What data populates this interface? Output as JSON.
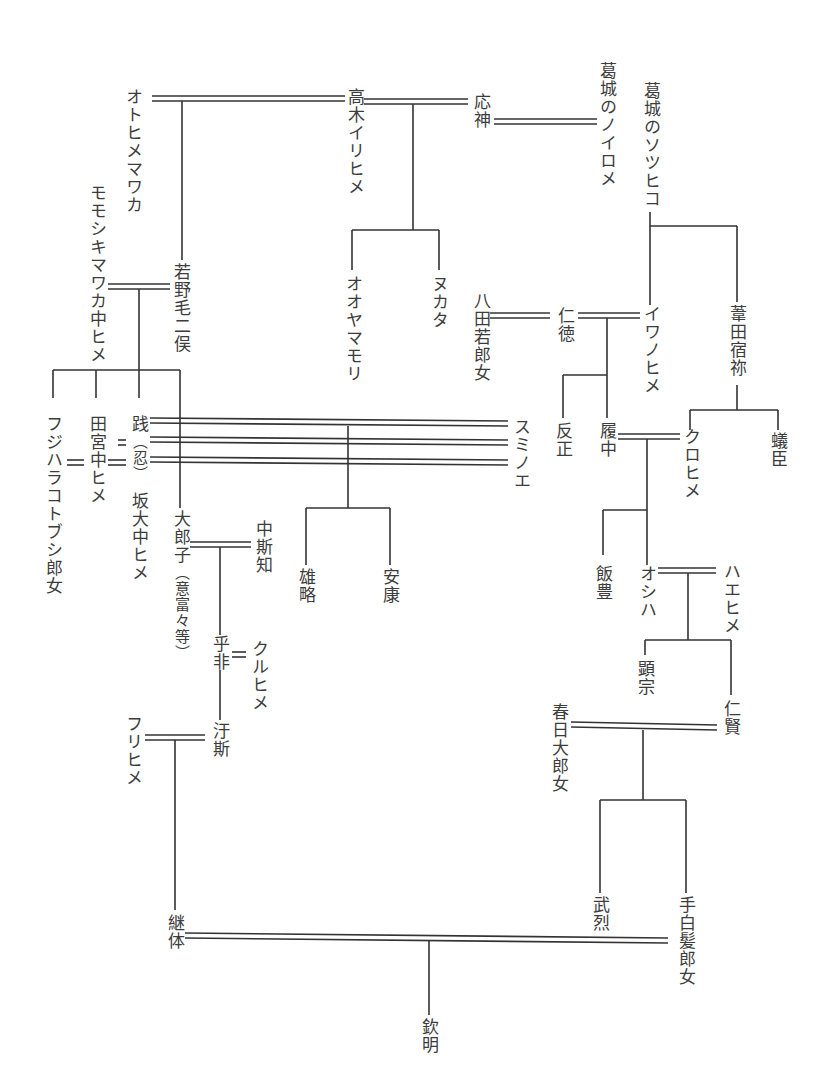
{
  "diagram": {
    "type": "genealogy",
    "people": {
      "otohime_mawaka": "オトヒメマワカ",
      "takaki_irihime": "高木イリヒメ",
      "ojin": "応神",
      "katsuragi_noirome": "葛城のノイロメ",
      "katsuragi_sotsuhiko": "葛城のソツヒコ",
      "momoshiki_mawaka": "モモシキマワカ中ヒメ",
      "wakanoke_futamata": "若野毛二俣",
      "oyamamori": "オオヤマモリ",
      "nukata": "ヌカタ",
      "yata_wakiiratsume": "八田若郎女",
      "nintoku": "仁徳",
      "iwanohime": "イワノヒメ",
      "ashida_sukune": "葦田宿祢",
      "hanzei": "反正",
      "richu": "履中",
      "kurohime": "クロヒメ",
      "ari_omi": "蟻臣",
      "fujihara_kotobushi": "フジハラコトブシ郎女",
      "tamiya_nakahime": "田宮中ヒメ",
      "sen": "践",
      "oshi_paren": "（忍）",
      "osaka_nakahime": "坂大中ヒメ",
      "sumino_e": "スミノエ",
      "oiratsuko": "大郎子",
      "ofuto_paren": "（意富々等）",
      "nakashichi": "中斯知",
      "yuryaku": "雄略",
      "anko": "安康",
      "iitoyo": "飯豊",
      "oshiha": "オシハ",
      "haehime": "ハエヒメ",
      "hohi": "乎非",
      "kuruhime": "クルヒメ",
      "kenzo": "顕宗",
      "ninken": "仁賢",
      "kasuga_oiratsume": "春日大郎女",
      "furihime": "フリヒメ",
      "ushi": "汙斯",
      "buretsu": "武烈",
      "tashiraka": "手白髪郎女",
      "keitai": "継体",
      "kinmei": "欽明"
    },
    "marriages": [
      [
        "otohime_mawaka",
        "takaki_irihime"
      ],
      [
        "takaki_irihime",
        "ojin"
      ],
      [
        "ojin",
        "katsuragi_noirome"
      ],
      [
        "momoshiki_mawaka",
        "wakanoke_futamata"
      ],
      [
        "yata_wakiiratsume",
        "nintoku"
      ],
      [
        "nintoku",
        "iwanohime"
      ],
      [
        "richu",
        "kurohime"
      ],
      [
        "sen",
        "sumino_e"
      ],
      [
        "oiratsuko",
        "nakashichi"
      ],
      [
        "oshiha",
        "haehime"
      ],
      [
        "hohi",
        "kuruhime"
      ],
      [
        "furihime",
        "ushi"
      ],
      [
        "kasuga_oiratsume",
        "ninken"
      ],
      [
        "keitai",
        "tashiraka"
      ]
    ],
    "colors": {
      "line": "#333333",
      "text": "#3c3c3c",
      "background": "#ffffff"
    }
  }
}
